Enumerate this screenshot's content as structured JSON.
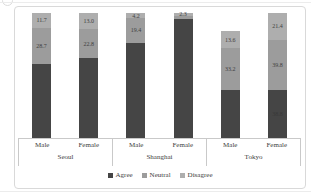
{
  "chart_data": {
    "type": "bar",
    "stacked": true,
    "title": "",
    "value_unit": "percent",
    "value_axis_visible": false,
    "grid": false,
    "legend_position": "bottom",
    "legend": [
      "Agree",
      "Neutral",
      "Disagree"
    ],
    "series": [
      {
        "name": "Agree",
        "color": "#454545"
      },
      {
        "name": "Neutral",
        "color": "#9c9c9c"
      },
      {
        "name": "Disagree",
        "color": "#aeaeae"
      }
    ],
    "groups": [
      {
        "label": "Seoul",
        "bars": [
          {
            "label": "Male",
            "segments": [
              {
                "series": "Disagree",
                "value": 11.7,
                "data_label": "11.7"
              },
              {
                "series": "Neutral",
                "value": 28.7,
                "data_label": "28.7"
              },
              {
                "series": "Agree",
                "value": 59.6,
                "data_label": ""
              }
            ]
          },
          {
            "label": "Female",
            "segments": [
              {
                "series": "Disagree",
                "value": 13.0,
                "data_label": "13.0"
              },
              {
                "series": "Neutral",
                "value": 22.8,
                "data_label": "22.8"
              },
              {
                "series": "Agree",
                "value": 64.2,
                "data_label": ""
              }
            ]
          }
        ]
      },
      {
        "label": "Shanghai",
        "bars": [
          {
            "label": "Male",
            "segments": [
              {
                "series": "Disagree",
                "value": 4.2,
                "data_label": "4.2"
              },
              {
                "series": "Neutral",
                "value": 19.4,
                "data_label": "19.4"
              },
              {
                "series": "Agree",
                "value": 76.4,
                "data_label": ""
              }
            ]
          },
          {
            "label": "Female",
            "segments": [
              {
                "series": "Disagree",
                "value": 2.3,
                "data_label": "2.3"
              },
              {
                "series": "Neutral",
                "value": 2.5,
                "data_label": ""
              },
              {
                "series": "Agree",
                "value": 95.2,
                "data_label": ""
              }
            ]
          }
        ]
      },
      {
        "label": "Tokyo",
        "bars": [
          {
            "label": "Male",
            "segments": [
              {
                "series": "Disagree",
                "value": 13.6,
                "data_label": "13.6"
              },
              {
                "series": "Neutral",
                "value": 33.2,
                "data_label": "33.2"
              },
              {
                "series": "Agree",
                "value": 38.8,
                "data_label": ""
              }
            ]
          },
          {
            "label": "Female",
            "segments": [
              {
                "series": "Disagree",
                "value": 21.4,
                "data_label": "21.4"
              },
              {
                "series": "Neutral",
                "value": 39.8,
                "data_label": "39.8"
              },
              {
                "series": "Agree",
                "value": 38.8,
                "data_label": "38.8"
              }
            ]
          }
        ]
      }
    ]
  },
  "colors": {
    "frame_border": "#d9d9d9",
    "axis_line": "#c9c9c9",
    "data_label_text": "#3f3f3f"
  }
}
